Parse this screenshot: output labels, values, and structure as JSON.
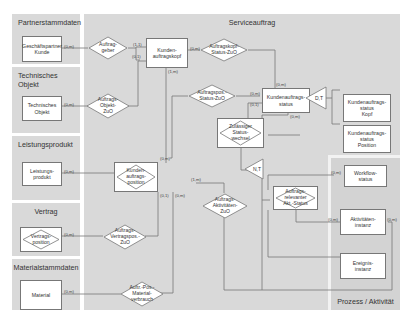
{
  "frames": {
    "partner": "Partnerstammdaten",
    "service": "Serviceauftrag",
    "technical": "Technisches Objekt",
    "service_product": "Leistungsprodukt",
    "contract": "Vertrag",
    "material_master": "Materialstammdaten",
    "process": "Prozess / Aktivität"
  },
  "entities": {
    "business_partner": "Geschäftspartner\nKunde",
    "technical_object": "Technisches\nObjekt",
    "service_product": "Leistungs-\nprodukt",
    "material": "Material",
    "order_header": "Kunden-\nauftragskopf",
    "order_status": "Kundenauftrags-\nstatus",
    "order_status_header": "Kundenauftrags-\nstatus\nKopf",
    "order_status_position": "Kundenauftrags-\nstatus\nPosition",
    "workflow_status": "Workflow-\nstatus",
    "activity_instance": "Aktivitäten-\ninstanz",
    "event_instance": "Ereignis-\ninstanz"
  },
  "relationships": {
    "order_giver": "Auftrag-\ngeber",
    "order_object": "Auftrags-\nObjekt-\nZuO",
    "header_status": "Auftragskopf-\nStatus-ZuO",
    "position_status": "Auftragspos.-\nStatus-ZuO",
    "allowed_status_change": "Zulässiger\nStatus-\nwechsel",
    "order_position": "Kunden-\nauftrags-\nposition",
    "contract_position": "Vertrags-\nposition",
    "order_contract": "Auftrags-\nVertragspos.-\nZuO",
    "order_activities": "Auftrags-\nAktivitäten-\nZuO",
    "relevant_status": "Auftrags-\nrelevanter\nAkt.-Status",
    "material_consumption": "Auftr.-Pos.-\nMaterial-\nverbrauch"
  },
  "generalizations": {
    "dt": "D,T",
    "nt": "N,T"
  },
  "cardinalities": {
    "bp": "(0,m)",
    "og_top": "(1,1)",
    "og_bot": "(0,1)",
    "to": "(0,m)",
    "hdr_right": "(0,m)",
    "hdr_bottom": "(1,m)",
    "st_top": "(0,m)",
    "pos_status_right": "(0,m)",
    "st_left2": "(0,1)",
    "st_bottom": "(0,m)",
    "allowed": "(0,m)",
    "sp": "(0,m)",
    "pos_top": "(0,m)",
    "pos_right": "(1,m)",
    "pos_b1": "(0,1)",
    "pos_b2": "(0,m)",
    "cp": "(0,m)",
    "mat": "(0,m)",
    "wf": "(0,m)",
    "act_left": "(0,m)",
    "act_right": "(0,m)"
  },
  "colors": {
    "frame": "#d9d9d9",
    "entity_fill": "#ffffff",
    "line": "#777777"
  }
}
